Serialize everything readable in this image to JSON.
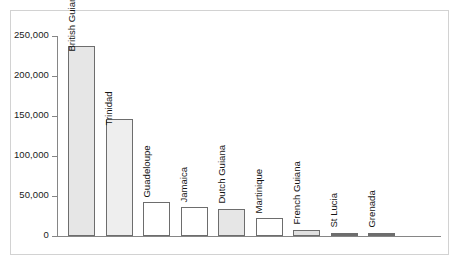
{
  "chart_data": {
    "type": "bar",
    "title": "",
    "subtitle": "",
    "xlabel": "",
    "ylabel": "",
    "ylim": [
      0,
      250000
    ],
    "grid": false,
    "legend": null,
    "orientation": "vertical",
    "categories": [
      "British Guiana",
      "Trinidad",
      "Guadeloupe",
      "Jamaica",
      "Dutch Guiana",
      "Martinique",
      "French Guiana",
      "St Lucia",
      "Grenada"
    ],
    "values": [
      238000,
      146000,
      42000,
      36000,
      34000,
      22000,
      8000,
      1500,
      2000
    ],
    "bar_fills": [
      "#e6e6e6",
      "#eeeeee",
      "#ffffff",
      "#ffffff",
      "#e6e6e6",
      "#ffffff",
      "#e0e0e0",
      "#6d6d6d",
      "#6d6d6d"
    ],
    "bar_outline": "#6d6d6d",
    "y_ticks": [
      {
        "value": 250000,
        "label": "250,000"
      },
      {
        "value": 200000,
        "label": "200,000"
      },
      {
        "value": 150000,
        "label": "150,000"
      },
      {
        "value": 100000,
        "label": "100,000"
      },
      {
        "value": 50000,
        "label": "50,000"
      },
      {
        "value": 0,
        "label": "0"
      }
    ],
    "axis_color": "#868686",
    "frame_color": "#d2d2d2",
    "background": "#ffffff"
  }
}
